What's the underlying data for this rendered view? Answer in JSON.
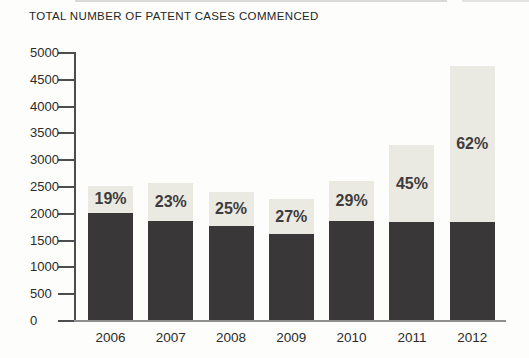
{
  "chart_data": {
    "type": "bar",
    "stacked": true,
    "title": "TOTAL NUMBER OF PATENT CASES COMMENCED",
    "categories": [
      "2006",
      "2007",
      "2008",
      "2009",
      "2010",
      "2011",
      "2012"
    ],
    "series": [
      {
        "name": "base-segment-dark",
        "color": "#3a3738",
        "values": [
          2000,
          1850,
          1750,
          1600,
          1840,
          1820,
          1835
        ]
      },
      {
        "name": "top-segment-light",
        "color": "#eae9e2",
        "values": [
          500,
          700,
          630,
          650,
          750,
          1440,
          2895
        ]
      }
    ],
    "totals": [
      2500,
      2550,
      2380,
      2250,
      2590,
      3260,
      4730
    ],
    "percent_labels": [
      "19%",
      "23%",
      "25%",
      "27%",
      "29%",
      "45%",
      "62%"
    ],
    "yticks": [
      "0",
      "500",
      "1000",
      "1500",
      "2000",
      "2500",
      "3000",
      "3500",
      "4000",
      "4500",
      "5000"
    ],
    "ylim": [
      0,
      5000
    ],
    "xlabel": "",
    "ylabel": "",
    "legend": "none",
    "grid": "off",
    "colors": {
      "dark_segment": "#3a3738",
      "light_segment": "#eae9e2",
      "percent_text": "#3f3c3d",
      "axis": "#4d4d4f",
      "baseline": "#8e8e8e",
      "label_text": "#2b2b2b",
      "artifact_line": "#d9d9d9"
    }
  }
}
